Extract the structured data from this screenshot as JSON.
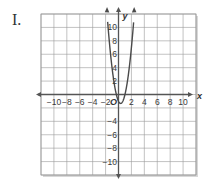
{
  "problem": {
    "label": "I."
  },
  "colors": {
    "grid": "#9a9a9a",
    "axis": "#555555",
    "curve": "#4a4a4a",
    "shadow": "#d8d8d8"
  },
  "chart_data": {
    "type": "line",
    "title": "",
    "xlabel": "x",
    "ylabel": "y",
    "xlim": [
      -12,
      12
    ],
    "ylim": [
      -12,
      12
    ],
    "grid": true,
    "grid_step": 2,
    "x_ticks": [
      -10,
      -8,
      -6,
      -4,
      -2,
      2,
      4,
      6,
      8,
      10
    ],
    "y_ticks": [
      10,
      8,
      6,
      4,
      2,
      -4,
      -6,
      -8,
      -10
    ],
    "origin_label": "O",
    "series": [
      {
        "name": "parabola",
        "equation": "y = 3x^2 - 2x - 1",
        "x": [
          -1.67,
          -1.5,
          -1,
          -0.5,
          -0.33,
          0,
          0.33,
          0.5,
          1,
          1.5,
          2,
          2.33
        ],
        "values": [
          12,
          8.75,
          4,
          0.75,
          0,
          -1,
          -1.33,
          -1.25,
          0,
          2.75,
          7,
          10.67
        ]
      }
    ]
  }
}
